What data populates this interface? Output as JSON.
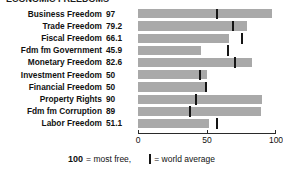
{
  "title_cropped": "ECONOMIC FREEDOMS",
  "chart_data": {
    "type": "bar",
    "title": "",
    "xlabel": "",
    "ylabel": "",
    "orientation": "horizontal",
    "xlim": [
      0,
      100
    ],
    "grid": false,
    "categories": [
      "Business Freedom",
      "Trade Freedom",
      "Fiscal Freedom",
      "Fdm fm Government",
      "Monetary Freedom",
      "Investment Freedom",
      "Financial Freedom",
      "Property Rights",
      "Fdm fm Corruption",
      "Labor Freedom"
    ],
    "values": [
      97,
      79.2,
      66.1,
      45.9,
      82.6,
      50,
      50,
      90,
      89,
      51.1
    ],
    "value_labels": [
      "97",
      "79.2",
      "66.1",
      "45.9",
      "82.6",
      "50",
      "50",
      "90",
      "89",
      "51.1"
    ],
    "series": [
      {
        "name": "Score",
        "values": [
          97,
          79.2,
          66.1,
          45.9,
          82.6,
          50,
          50,
          90,
          89,
          51.1
        ]
      },
      {
        "name": "World average",
        "values": [
          57,
          69,
          75,
          65,
          70,
          45,
          49,
          42,
          38,
          57
        ]
      }
    ],
    "bar_color": "#a9a9a9",
    "marker_color": "#151515",
    "axis_ticks": [
      0,
      50,
      100
    ],
    "axis_tick_labels": [
      "0",
      "50",
      "100"
    ],
    "legend_position": "bottom",
    "legend": [
      {
        "label": "= most free,",
        "prefix": "100"
      },
      {
        "label": "= world average",
        "marker": "world-average-marker"
      }
    ]
  },
  "rows": [
    {
      "label": "Business Freedom",
      "value_label": "97",
      "value": 97,
      "avg": 57
    },
    {
      "label": "Trade Freedom",
      "value_label": "79.2",
      "value": 79.2,
      "avg": 69
    },
    {
      "label": "Fiscal Freedom",
      "value_label": "66.1",
      "value": 66.1,
      "avg": 75
    },
    {
      "label": "Fdm fm Government",
      "value_label": "45.9",
      "value": 45.9,
      "avg": 65
    },
    {
      "label": "Monetary Freedom",
      "value_label": "82.6",
      "value": 82.6,
      "avg": 70
    },
    {
      "label": "Investment Freedom",
      "value_label": "50",
      "value": 50,
      "avg": 45
    },
    {
      "label": "Financial Freedom",
      "value_label": "50",
      "value": 50,
      "avg": 49
    },
    {
      "label": "Property Rights",
      "value_label": "90",
      "value": 90,
      "avg": 42
    },
    {
      "label": "Fdm fm Corruption",
      "value_label": "89",
      "value": 89,
      "avg": 38
    },
    {
      "label": "Labor Freedom",
      "value_label": "51.1",
      "value": 51.1,
      "avg": 57
    }
  ],
  "axis": {
    "ticks": [
      {
        "value": 0,
        "label": "0"
      },
      {
        "value": 50,
        "label": "50"
      },
      {
        "value": 100,
        "label": "100"
      }
    ]
  },
  "legend": {
    "most_free_number": "100",
    "most_free_text": "= most free,",
    "world_average_text": "= world average"
  }
}
